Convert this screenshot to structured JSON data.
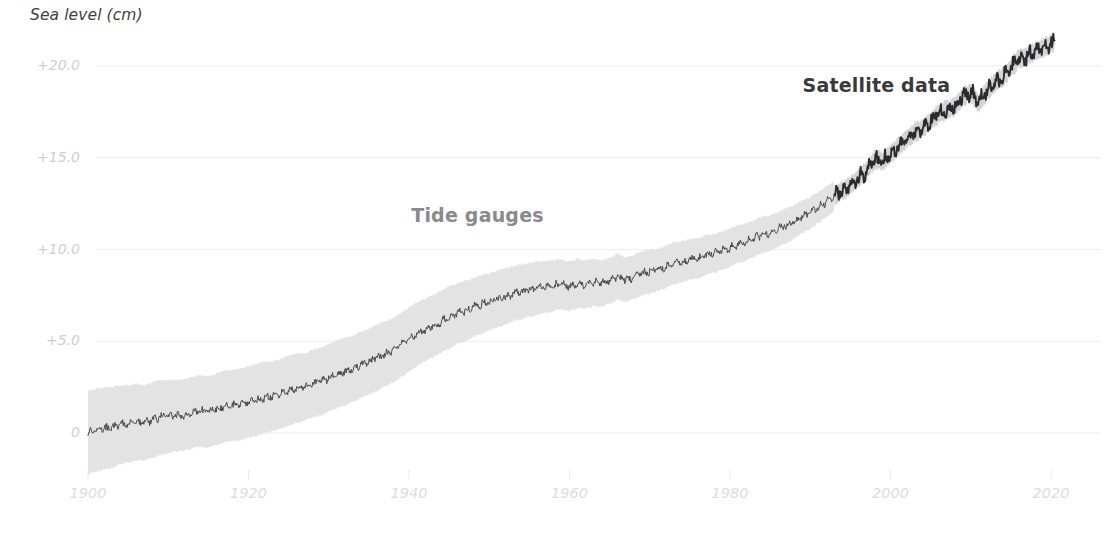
{
  "chart_data": {
    "type": "line",
    "title": "Sea level (cm)",
    "xlabel": "",
    "ylabel": "Sea level (cm)",
    "xlim": [
      1900,
      2021
    ],
    "ylim": [
      -2.5,
      22.5
    ],
    "grid": true,
    "legend_position": "inline-annotations",
    "x_ticks": [
      "1900",
      "1920",
      "1940",
      "1960",
      "1980",
      "2000",
      "2020"
    ],
    "x_tick_values": [
      1900,
      1920,
      1940,
      1960,
      1980,
      2000,
      2020
    ],
    "y_ticks": [
      "+20.0",
      "+15.0",
      "+10.0",
      "+5.0",
      "0"
    ],
    "y_tick_values": [
      20,
      15,
      10,
      5,
      0
    ],
    "annotations": [
      {
        "text": "Tide gauges",
        "x": 1950,
        "y": 11.8,
        "color": "#8a8a8c"
      },
      {
        "text": "Satellite data",
        "x": 2000,
        "y": 18.9,
        "color": "#3a3a3c"
      }
    ],
    "series": [
      {
        "name": "Tide gauges",
        "color": "#4a4a4c",
        "band_color": "#e2e2e2",
        "x_start": 1900,
        "x_end": 1993,
        "x": [
          1900,
          1901,
          1902,
          1903,
          1904,
          1905,
          1906,
          1907,
          1908,
          1909,
          1910,
          1911,
          1912,
          1913,
          1914,
          1915,
          1916,
          1917,
          1918,
          1919,
          1920,
          1921,
          1922,
          1923,
          1924,
          1925,
          1926,
          1927,
          1928,
          1929,
          1930,
          1931,
          1932,
          1933,
          1934,
          1935,
          1936,
          1937,
          1938,
          1939,
          1940,
          1941,
          1942,
          1943,
          1944,
          1945,
          1946,
          1947,
          1948,
          1949,
          1950,
          1951,
          1952,
          1953,
          1954,
          1955,
          1956,
          1957,
          1958,
          1959,
          1960,
          1961,
          1962,
          1963,
          1964,
          1965,
          1966,
          1967,
          1968,
          1969,
          1970,
          1971,
          1972,
          1973,
          1974,
          1975,
          1976,
          1977,
          1978,
          1979,
          1980,
          1981,
          1982,
          1983,
          1984,
          1985,
          1986,
          1987,
          1988,
          1989,
          1990,
          1991,
          1992,
          1993
        ],
        "values": [
          0.0,
          0.15,
          0.25,
          0.3,
          0.45,
          0.5,
          0.6,
          0.55,
          0.7,
          0.85,
          0.9,
          0.95,
          1.0,
          1.1,
          1.2,
          1.15,
          1.3,
          1.45,
          1.5,
          1.55,
          1.7,
          1.8,
          1.95,
          2.0,
          2.15,
          2.3,
          2.45,
          2.5,
          2.7,
          2.8,
          3.0,
          3.2,
          3.35,
          3.5,
          3.7,
          3.9,
          4.1,
          4.3,
          4.5,
          4.8,
          5.1,
          5.4,
          5.6,
          5.85,
          6.05,
          6.3,
          6.5,
          6.65,
          6.85,
          7.0,
          7.15,
          7.3,
          7.45,
          7.6,
          7.7,
          7.8,
          7.9,
          7.95,
          8.05,
          8.1,
          8.0,
          8.15,
          8.1,
          8.2,
          8.15,
          8.3,
          8.5,
          8.35,
          8.5,
          8.7,
          8.8,
          8.9,
          9.05,
          9.25,
          9.3,
          9.45,
          9.5,
          9.7,
          9.8,
          9.95,
          10.1,
          10.3,
          10.4,
          10.6,
          10.8,
          10.9,
          11.1,
          11.3,
          11.5,
          11.8,
          12.0,
          12.3,
          12.6,
          12.9
        ],
        "band_lower": [
          -2.3,
          -2.1,
          -2.0,
          -1.9,
          -1.7,
          -1.6,
          -1.5,
          -1.5,
          -1.35,
          -1.2,
          -1.1,
          -1.0,
          -0.95,
          -0.85,
          -0.75,
          -0.8,
          -0.65,
          -0.5,
          -0.45,
          -0.4,
          -0.25,
          -0.15,
          0.0,
          0.1,
          0.25,
          0.4,
          0.55,
          0.65,
          0.85,
          0.95,
          1.15,
          1.35,
          1.5,
          1.7,
          1.9,
          2.1,
          2.3,
          2.55,
          2.75,
          3.05,
          3.35,
          3.65,
          3.9,
          4.15,
          4.35,
          4.6,
          4.85,
          5.0,
          5.25,
          5.4,
          5.6,
          5.75,
          5.9,
          6.1,
          6.2,
          6.35,
          6.45,
          6.55,
          6.65,
          6.75,
          6.65,
          6.8,
          6.8,
          6.9,
          6.9,
          7.05,
          7.25,
          7.15,
          7.3,
          7.5,
          7.6,
          7.75,
          7.9,
          8.1,
          8.2,
          8.35,
          8.4,
          8.6,
          8.75,
          8.9,
          9.05,
          9.25,
          9.4,
          9.6,
          9.8,
          9.95,
          10.15,
          10.35,
          10.6,
          10.9,
          11.15,
          11.45,
          11.75,
          12.1
        ],
        "band_upper": [
          2.3,
          2.4,
          2.5,
          2.5,
          2.6,
          2.6,
          2.7,
          2.6,
          2.75,
          2.9,
          2.9,
          2.9,
          2.95,
          3.05,
          3.15,
          3.1,
          3.25,
          3.4,
          3.45,
          3.5,
          3.65,
          3.75,
          3.9,
          3.9,
          4.05,
          4.2,
          4.35,
          4.35,
          4.55,
          4.65,
          4.85,
          5.05,
          5.2,
          5.3,
          5.5,
          5.7,
          5.9,
          6.05,
          6.25,
          6.55,
          6.85,
          7.15,
          7.3,
          7.55,
          7.75,
          8.0,
          8.15,
          8.3,
          8.45,
          8.6,
          8.7,
          8.85,
          9.0,
          9.1,
          9.2,
          9.25,
          9.35,
          9.35,
          9.45,
          9.45,
          9.35,
          9.5,
          9.4,
          9.5,
          9.4,
          9.55,
          9.75,
          9.55,
          9.7,
          9.9,
          10.0,
          10.05,
          10.2,
          10.4,
          10.45,
          10.6,
          10.6,
          10.8,
          10.85,
          11.0,
          11.15,
          11.35,
          11.4,
          11.6,
          11.8,
          11.85,
          12.05,
          12.25,
          12.4,
          12.7,
          12.85,
          13.15,
          13.45,
          13.7
        ]
      },
      {
        "name": "Satellite data",
        "color": "#2b2b2d",
        "band_color": "#cfcfcf",
        "x_start": 1993,
        "x_end": 2020.5,
        "x": [
          1993,
          1994,
          1995,
          1996,
          1997,
          1998,
          1999,
          2000,
          2001,
          2002,
          2003,
          2004,
          2005,
          2006,
          2007,
          2008,
          2009,
          2010,
          2011,
          2012,
          2013,
          2014,
          2015,
          2016,
          2017,
          2018,
          2019,
          2020,
          2020.5
        ],
        "values": [
          12.9,
          13.2,
          13.5,
          13.9,
          14.3,
          14.9,
          14.8,
          15.2,
          15.6,
          16.0,
          16.4,
          16.6,
          17.0,
          17.4,
          17.6,
          17.8,
          18.3,
          18.6,
          18.0,
          18.6,
          19.1,
          19.4,
          19.9,
          20.4,
          20.5,
          20.8,
          21.0,
          21.2,
          21.4
        ],
        "band_lower": [
          12.4,
          12.7,
          13.0,
          13.4,
          13.8,
          14.4,
          14.3,
          14.7,
          15.1,
          15.5,
          15.9,
          16.1,
          16.5,
          16.9,
          17.1,
          17.3,
          17.8,
          18.1,
          17.5,
          18.1,
          18.6,
          18.9,
          19.4,
          19.9,
          20.0,
          20.3,
          20.5,
          20.7,
          20.9
        ],
        "band_upper": [
          13.4,
          13.7,
          14.0,
          14.4,
          14.8,
          15.4,
          15.3,
          15.7,
          16.1,
          16.5,
          16.9,
          17.1,
          17.5,
          17.9,
          18.1,
          18.3,
          18.8,
          19.1,
          18.5,
          19.1,
          19.6,
          19.9,
          20.4,
          20.9,
          21.0,
          21.3,
          21.5,
          21.7,
          21.9
        ]
      }
    ],
    "colors": {
      "gridline": "#ededf0",
      "tide_line": "#4a4a4c",
      "tide_band": "#e2e2e2",
      "satellite_line": "#2b2b2d",
      "satellite_band": "#cfcfcf",
      "tick_label": "#d8d8db",
      "title": "#3f3f3f"
    }
  }
}
